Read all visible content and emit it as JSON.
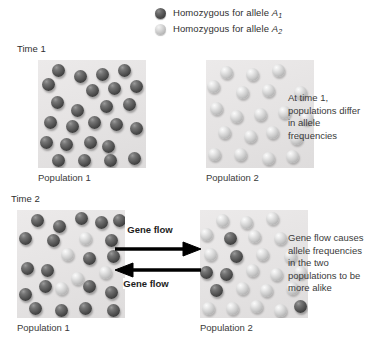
{
  "legend": {
    "items": [
      {
        "swatch": "dark-sphere-icon",
        "text_prefix": "Homozygous for allele ",
        "allele": "A",
        "subscript": "1"
      },
      {
        "swatch": "light-sphere-icon",
        "text_prefix": "Homozygous for allele ",
        "allele": "A",
        "subscript": "2"
      }
    ]
  },
  "rows": {
    "time_1": {
      "time_label": "Time 1",
      "left_panel_caption": "Population 1",
      "right_panel_caption": "Population 2",
      "note": "At time 1, populations differ in allele frequencies"
    },
    "time_2": {
      "time_label": "Time 2",
      "left_panel_caption": "Population 1",
      "right_panel_caption": "Population 2",
      "note": "Gene flow causes allele frequencies in the two populations to be more alike"
    }
  },
  "gene_flow": {
    "top_label": "Gene flow",
    "bottom_label": "Gene flow",
    "top_arrow_direction": "right",
    "bottom_arrow_direction": "left"
  },
  "colors": {
    "allele_a1_sphere": "#4a4a4a",
    "allele_a2_sphere": "#c8c8c8",
    "panel_background": "#e6e4e4",
    "page_background": "#ffffff",
    "text": "#3a3a3a"
  },
  "chart_data": {
    "type": "diagram",
    "panels": [
      {
        "id": "t1-p1",
        "time": "Time 1",
        "population": "Population 1",
        "counts": {
          "dark_A1": 24,
          "light_A2": 0
        },
        "spheres": [
          {
            "x": 14,
            "y": 4,
            "type": "dark"
          },
          {
            "x": 36,
            "y": 10,
            "type": "dark"
          },
          {
            "x": 58,
            "y": 8,
            "type": "dark"
          },
          {
            "x": 80,
            "y": 4,
            "type": "dark"
          },
          {
            "x": 4,
            "y": 18,
            "type": "dark"
          },
          {
            "x": 48,
            "y": 24,
            "type": "dark"
          },
          {
            "x": 70,
            "y": 22,
            "type": "dark"
          },
          {
            "x": 92,
            "y": 20,
            "type": "dark"
          },
          {
            "x": 13,
            "y": 36,
            "type": "dark"
          },
          {
            "x": 33,
            "y": 44,
            "type": "dark"
          },
          {
            "x": 62,
            "y": 40,
            "type": "dark"
          },
          {
            "x": 85,
            "y": 38,
            "type": "dark"
          },
          {
            "x": 6,
            "y": 56,
            "type": "dark"
          },
          {
            "x": 28,
            "y": 60,
            "type": "dark"
          },
          {
            "x": 50,
            "y": 56,
            "type": "dark"
          },
          {
            "x": 72,
            "y": 58,
            "type": "dark"
          },
          {
            "x": 92,
            "y": 62,
            "type": "dark"
          },
          {
            "x": 2,
            "y": 76,
            "type": "dark"
          },
          {
            "x": 22,
            "y": 78,
            "type": "dark"
          },
          {
            "x": 46,
            "y": 76,
            "type": "dark"
          },
          {
            "x": 64,
            "y": 80,
            "type": "dark"
          },
          {
            "x": 14,
            "y": 94,
            "type": "dark"
          },
          {
            "x": 40,
            "y": 94,
            "type": "dark"
          },
          {
            "x": 66,
            "y": 94,
            "type": "dark"
          },
          {
            "x": 90,
            "y": 92,
            "type": "dark"
          }
        ]
      },
      {
        "id": "t1-p2",
        "time": "Time 1",
        "population": "Population 2",
        "counts": {
          "dark_A1": 0,
          "light_A2": 20
        },
        "spheres": [
          {
            "x": 14,
            "y": 6,
            "type": "light"
          },
          {
            "x": 40,
            "y": 8,
            "type": "light"
          },
          {
            "x": 66,
            "y": 4,
            "type": "light"
          },
          {
            "x": 1,
            "y": 20,
            "type": "light"
          },
          {
            "x": 30,
            "y": 26,
            "type": "light"
          },
          {
            "x": 56,
            "y": 24,
            "type": "light"
          },
          {
            "x": 88,
            "y": 26,
            "type": "light"
          },
          {
            "x": 4,
            "y": 42,
            "type": "light"
          },
          {
            "x": 24,
            "y": 50,
            "type": "light"
          },
          {
            "x": 48,
            "y": 48,
            "type": "light"
          },
          {
            "x": 72,
            "y": 46,
            "type": "light"
          },
          {
            "x": 94,
            "y": 52,
            "type": "light"
          },
          {
            "x": 12,
            "y": 66,
            "type": "light"
          },
          {
            "x": 38,
            "y": 70,
            "type": "light"
          },
          {
            "x": 60,
            "y": 66,
            "type": "light"
          },
          {
            "x": 84,
            "y": 72,
            "type": "light"
          },
          {
            "x": 2,
            "y": 88,
            "type": "light"
          },
          {
            "x": 28,
            "y": 88,
            "type": "light"
          },
          {
            "x": 56,
            "y": 92,
            "type": "light"
          },
          {
            "x": 80,
            "y": 90,
            "type": "light"
          }
        ]
      },
      {
        "id": "t2-p1",
        "time": "Time 2",
        "population": "Population 1",
        "counts": {
          "dark_A1": 20,
          "light_A2": 5
        },
        "spheres": [
          {
            "x": 14,
            "y": 4,
            "type": "dark"
          },
          {
            "x": 36,
            "y": 10,
            "type": "dark"
          },
          {
            "x": 58,
            "y": 2,
            "type": "dark"
          },
          {
            "x": 78,
            "y": 6,
            "type": "dark"
          },
          {
            "x": 96,
            "y": 4,
            "type": "dark"
          },
          {
            "x": 2,
            "y": 22,
            "type": "dark"
          },
          {
            "x": 30,
            "y": 24,
            "type": "dark"
          },
          {
            "x": 62,
            "y": 22,
            "type": "light"
          },
          {
            "x": 88,
            "y": 24,
            "type": "dark"
          },
          {
            "x": 44,
            "y": 38,
            "type": "light"
          },
          {
            "x": 66,
            "y": 42,
            "type": "dark"
          },
          {
            "x": 90,
            "y": 40,
            "type": "dark"
          },
          {
            "x": 4,
            "y": 52,
            "type": "dark"
          },
          {
            "x": 24,
            "y": 54,
            "type": "dark"
          },
          {
            "x": 82,
            "y": 56,
            "type": "light"
          },
          {
            "x": 54,
            "y": 62,
            "type": "light"
          },
          {
            "x": 22,
            "y": 70,
            "type": "dark"
          },
          {
            "x": 38,
            "y": 72,
            "type": "light"
          },
          {
            "x": 66,
            "y": 70,
            "type": "dark"
          },
          {
            "x": 2,
            "y": 78,
            "type": "dark"
          },
          {
            "x": 88,
            "y": 76,
            "type": "dark"
          },
          {
            "x": 12,
            "y": 92,
            "type": "dark"
          },
          {
            "x": 38,
            "y": 94,
            "type": "dark"
          },
          {
            "x": 62,
            "y": 92,
            "type": "dark"
          },
          {
            "x": 90,
            "y": 94,
            "type": "dark"
          }
        ]
      },
      {
        "id": "t2-p2",
        "time": "Time 2",
        "population": "Population 2",
        "counts": {
          "dark_A1": 6,
          "light_A2": 19
        },
        "spheres": [
          {
            "x": 16,
            "y": 4,
            "type": "light"
          },
          {
            "x": 40,
            "y": 6,
            "type": "light"
          },
          {
            "x": 66,
            "y": 2,
            "type": "light"
          },
          {
            "x": 0,
            "y": 18,
            "type": "light"
          },
          {
            "x": 24,
            "y": 22,
            "type": "dark"
          },
          {
            "x": 48,
            "y": 20,
            "type": "light"
          },
          {
            "x": 74,
            "y": 22,
            "type": "light"
          },
          {
            "x": 4,
            "y": 38,
            "type": "light"
          },
          {
            "x": 30,
            "y": 40,
            "type": "dark"
          },
          {
            "x": 56,
            "y": 38,
            "type": "light"
          },
          {
            "x": 84,
            "y": 40,
            "type": "light"
          },
          {
            "x": 0,
            "y": 56,
            "type": "dark"
          },
          {
            "x": 20,
            "y": 58,
            "type": "dark"
          },
          {
            "x": 46,
            "y": 54,
            "type": "light"
          },
          {
            "x": 70,
            "y": 58,
            "type": "light"
          },
          {
            "x": 94,
            "y": 56,
            "type": "light"
          },
          {
            "x": 10,
            "y": 74,
            "type": "dark"
          },
          {
            "x": 36,
            "y": 72,
            "type": "light"
          },
          {
            "x": 60,
            "y": 74,
            "type": "light"
          },
          {
            "x": 86,
            "y": 72,
            "type": "light"
          },
          {
            "x": 2,
            "y": 92,
            "type": "light"
          },
          {
            "x": 26,
            "y": 92,
            "type": "light"
          },
          {
            "x": 50,
            "y": 90,
            "type": "light"
          },
          {
            "x": 74,
            "y": 94,
            "type": "light"
          },
          {
            "x": 94,
            "y": 90,
            "type": "dark"
          }
        ]
      }
    ]
  }
}
